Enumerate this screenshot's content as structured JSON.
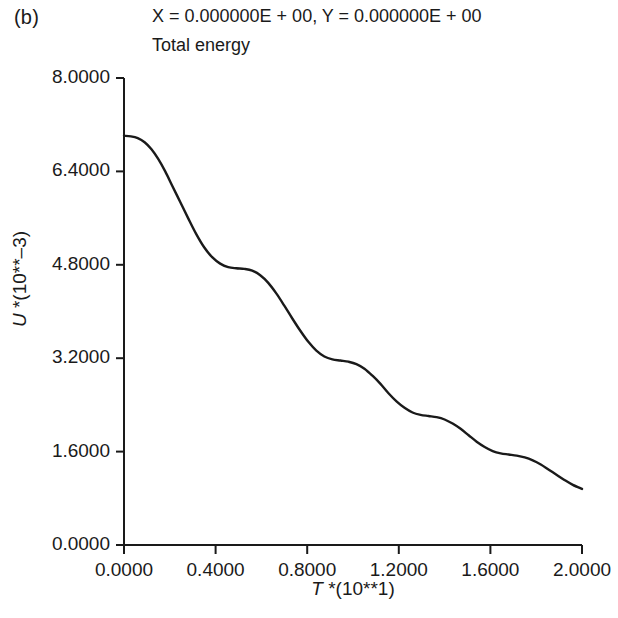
{
  "panel": {
    "label": "(b)"
  },
  "header": {
    "coords": "X = 0.000000E + 00, Y = 0.000000E + 00",
    "title": "Total energy"
  },
  "chart_data": {
    "type": "line",
    "title": "Total energy",
    "annotation": "X = 0.000000E + 00, Y = 0.000000E + 00",
    "panel_label": "(b)",
    "xlabel": "T *(10**1)",
    "ylabel": "U *(10**-3)",
    "xlim": [
      0.0,
      2.0
    ],
    "ylim": [
      0.0,
      8.0
    ],
    "grid": false,
    "legend": null,
    "line_color": "#1a1a1a",
    "line_width": 2.4,
    "xticks": [
      "0.0000",
      "0.4000",
      "0.8000",
      "1.2000",
      "1.6000",
      "2.0000"
    ],
    "xtick_values": [
      0.0,
      0.4,
      0.8,
      1.2,
      1.6,
      2.0
    ],
    "yticks": [
      "8.0000",
      "6.4000",
      "4.8000",
      "3.2000",
      "1.6000",
      "0.0000"
    ],
    "ytick_values": [
      8.0,
      6.4,
      4.8,
      3.2,
      1.6,
      0.0
    ],
    "series": [
      {
        "name": "Total energy",
        "x": [
          0.0,
          0.03,
          0.06,
          0.09,
          0.12,
          0.15,
          0.18,
          0.21,
          0.245,
          0.28,
          0.315,
          0.35,
          0.385,
          0.42,
          0.455,
          0.49,
          0.525,
          0.56,
          0.595,
          0.63,
          0.665,
          0.7,
          0.735,
          0.77,
          0.805,
          0.84,
          0.875,
          0.91,
          0.945,
          0.98,
          1.015,
          1.05,
          1.085,
          1.12,
          1.155,
          1.19,
          1.225,
          1.26,
          1.295,
          1.33,
          1.365,
          1.4,
          1.435,
          1.47,
          1.505,
          1.54,
          1.575,
          1.61,
          1.645,
          1.68,
          1.715,
          1.75,
          1.785,
          1.82,
          1.855,
          1.89,
          1.925,
          1.96,
          2.0
        ],
        "y": [
          7.01,
          7.0,
          6.97,
          6.9,
          6.78,
          6.61,
          6.4,
          6.16,
          5.88,
          5.6,
          5.33,
          5.1,
          4.93,
          4.82,
          4.76,
          4.74,
          4.73,
          4.7,
          4.62,
          4.49,
          4.31,
          4.1,
          3.88,
          3.67,
          3.48,
          3.33,
          3.23,
          3.18,
          3.16,
          3.14,
          3.1,
          3.02,
          2.9,
          2.76,
          2.6,
          2.46,
          2.35,
          2.27,
          2.23,
          2.21,
          2.19,
          2.15,
          2.08,
          1.99,
          1.88,
          1.77,
          1.68,
          1.61,
          1.57,
          1.55,
          1.53,
          1.5,
          1.45,
          1.38,
          1.29,
          1.2,
          1.11,
          1.03,
          0.96
        ]
      }
    ]
  },
  "axes": {
    "ylabel_text": "U *(10**-3)",
    "ylabel_var": "U",
    "ylabel_rest": " *(10**–3)",
    "xlabel_var": "T",
    "xlabel_rest": " *(10**1)"
  }
}
